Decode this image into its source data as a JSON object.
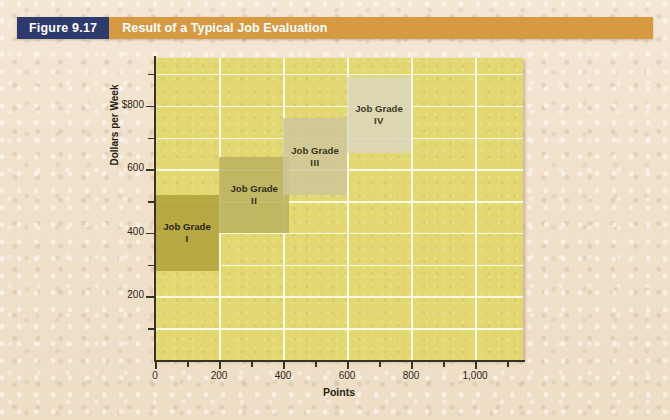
{
  "caption": {
    "figure_number": "Figure 9.17",
    "title": "Result of a Typical Job Evaluation",
    "number_bg": "#2c3a6e",
    "title_bg": "#d79a42",
    "text_color": "#ffffff"
  },
  "page": {
    "background": "#f2e3ce"
  },
  "chart_data": {
    "type": "bar",
    "title": "Result of a Typical Job Evaluation",
    "xlabel": "Points",
    "ylabel": "Dollars per Week",
    "xlim": [
      0,
      1150
    ],
    "ylim": [
      0,
      950
    ],
    "grid": true,
    "legend": "none",
    "plot_background": "#e2d771",
    "gridline_color": "#fdfbe8",
    "x_ticks_major": [
      0,
      200,
      400,
      600,
      800,
      1000
    ],
    "x_tick_labels": [
      "0",
      "200",
      "400",
      "600",
      "800",
      "1,000"
    ],
    "x_ticks_minor": [
      100,
      300,
      500,
      700,
      900,
      1100
    ],
    "y_ticks_major": [
      200,
      400,
      600,
      800
    ],
    "y_tick_labels": [
      "200",
      "400",
      "600",
      "$800"
    ],
    "y_ticks_minor": [
      100,
      300,
      500,
      700,
      900
    ],
    "boxes": [
      {
        "label_line1": "Job Grade",
        "label_line2": "I",
        "x_start": 0,
        "x_end": 200,
        "y_bottom": 280,
        "y_top": 520,
        "color": "#b3a63f",
        "opacity": 0.92
      },
      {
        "label_line1": "Job Grade",
        "label_line2": "II",
        "x_start": 200,
        "x_end": 420,
        "y_bottom": 400,
        "y_top": 640,
        "color": "#bdb261",
        "opacity": 0.88
      },
      {
        "label_line1": "Job Grade",
        "label_line2": "III",
        "x_start": 400,
        "x_end": 600,
        "y_bottom": 520,
        "y_top": 760,
        "color": "#cfc69b",
        "opacity": 0.85
      },
      {
        "label_line1": "Job Grade",
        "label_line2": "IV",
        "x_start": 600,
        "x_end": 800,
        "y_bottom": 650,
        "y_top": 890,
        "color": "#dcd7c0",
        "opacity": 0.82
      }
    ]
  }
}
